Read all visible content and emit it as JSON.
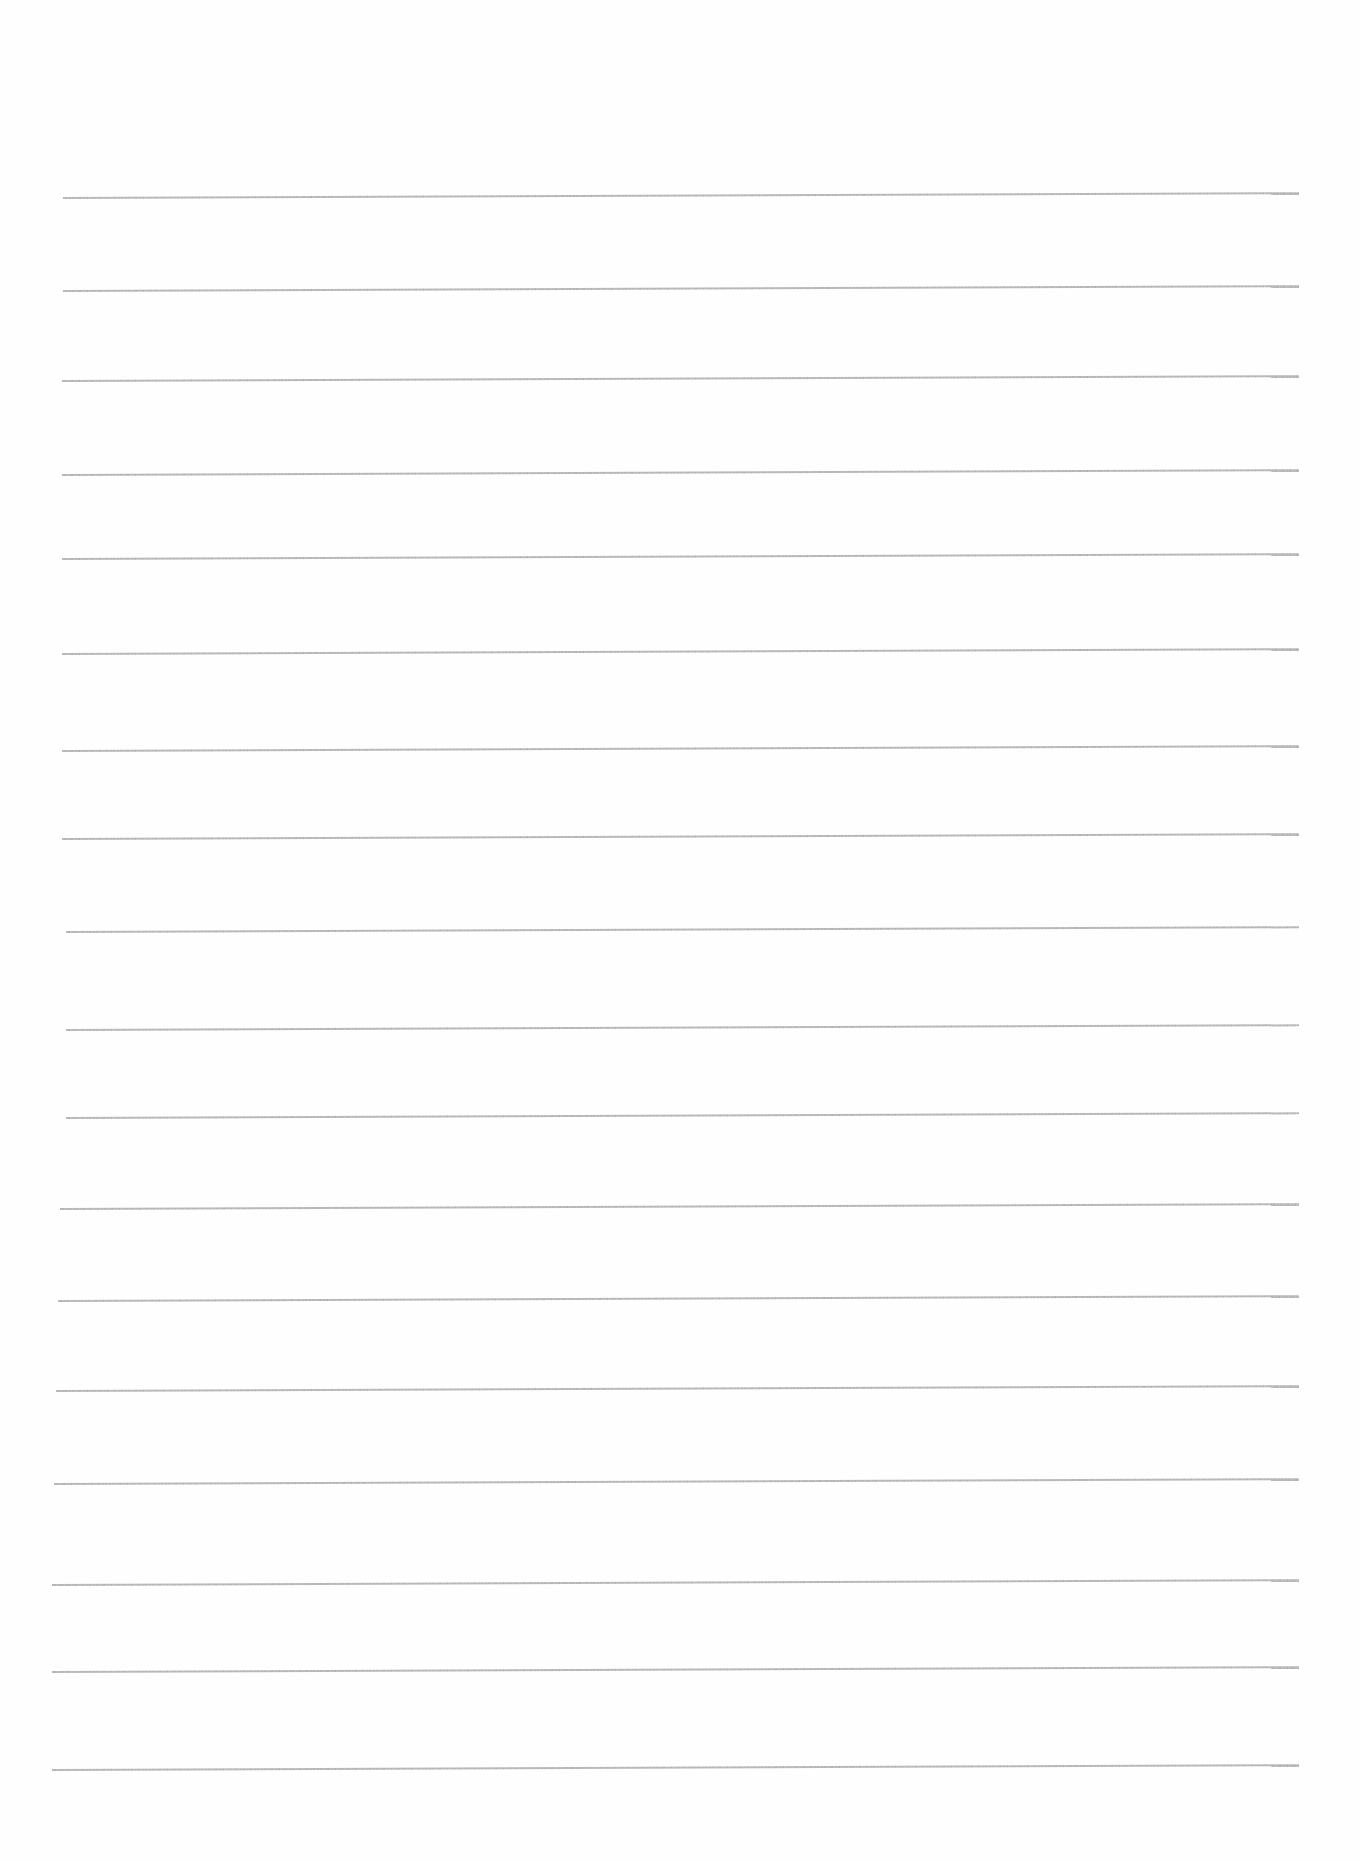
{
  "page": {
    "type": "ruled-paper",
    "background_color": "#fefefe",
    "line_color": "#a8a8a8",
    "line_thickness_px": 2,
    "line_tilt_deg": -0.22
  },
  "ruled_lines": [
    {
      "y": 197,
      "x1": 63,
      "x2": 1299
    },
    {
      "y": 290,
      "x1": 63,
      "x2": 1299
    },
    {
      "y": 380,
      "x1": 62,
      "x2": 1299
    },
    {
      "y": 474,
      "x1": 62,
      "x2": 1299
    },
    {
      "y": 558,
      "x1": 62,
      "x2": 1299
    },
    {
      "y": 653,
      "x1": 62,
      "x2": 1299
    },
    {
      "y": 750,
      "x1": 62,
      "x2": 1299
    },
    {
      "y": 838,
      "x1": 62,
      "x2": 1299
    },
    {
      "y": 931,
      "x1": 66,
      "x2": 1299
    },
    {
      "y": 1029,
      "x1": 66,
      "x2": 1299
    },
    {
      "y": 1117,
      "x1": 66,
      "x2": 1299
    },
    {
      "y": 1208,
      "x1": 60,
      "x2": 1299
    },
    {
      "y": 1300,
      "x1": 58,
      "x2": 1299
    },
    {
      "y": 1390,
      "x1": 56,
      "x2": 1299
    },
    {
      "y": 1483,
      "x1": 54,
      "x2": 1299
    },
    {
      "y": 1584,
      "x1": 52,
      "x2": 1299
    },
    {
      "y": 1671,
      "x1": 52,
      "x2": 1299
    },
    {
      "y": 1769,
      "x1": 52,
      "x2": 1299
    }
  ]
}
